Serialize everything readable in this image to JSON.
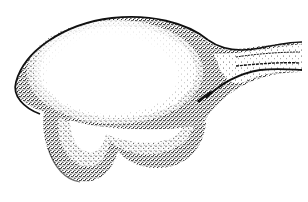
{
  "illustration": {
    "subject": "stippled-organ-illustration",
    "style": "pen-and-ink stipple",
    "colors": {
      "background": "#ffffff",
      "ink": "#111111",
      "stipple": "#222222"
    },
    "parts": [
      {
        "name": "main-body",
        "description": "rounded bulbous body with dense stippled rim"
      },
      {
        "name": "stalk",
        "description": "tapering duct extending to the right"
      },
      {
        "name": "lower-lobes",
        "description": "two rounded stippled lobes at the bottom"
      }
    ]
  }
}
